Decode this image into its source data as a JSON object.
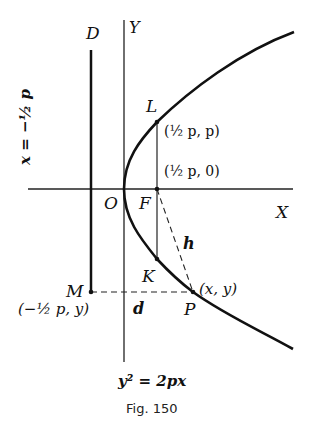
{
  "figure": {
    "caption": "Fig. 150",
    "equation": "y² = 2px",
    "directrix_equation": "x = −½ p",
    "labels": {
      "D": "D",
      "Y": "Y",
      "X": "X",
      "O": "O",
      "F": "F",
      "L": "L",
      "K": "K",
      "M": "M",
      "P": "P",
      "h": "h",
      "d": "d"
    },
    "coordinates": {
      "L": "(½ p, p)",
      "F": "(½ p, 0)",
      "P": "(x, y)",
      "M": "(−½ p, y)"
    }
  }
}
